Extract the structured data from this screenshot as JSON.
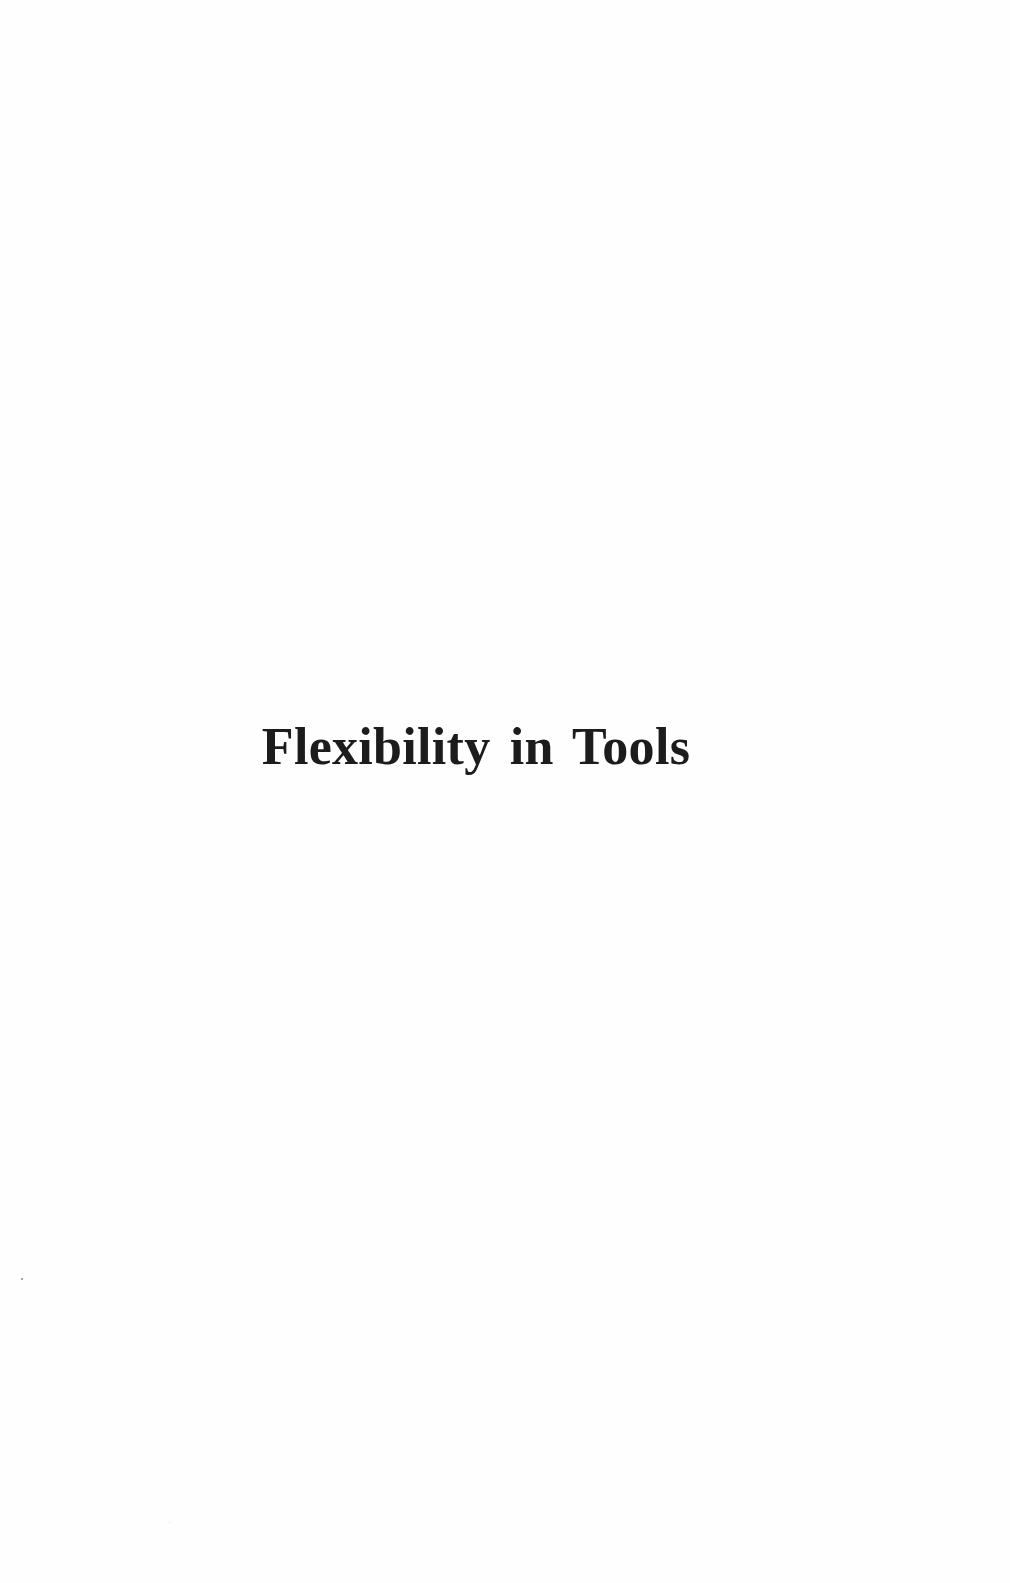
{
  "page": {
    "section_title": "Flexibility in Tools"
  },
  "colors": {
    "background": "#fefefe",
    "text": "#1c1c1c"
  }
}
